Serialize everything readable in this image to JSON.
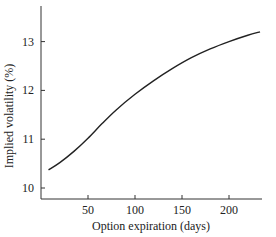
{
  "chart_data": {
    "type": "line",
    "title": "",
    "xlabel": "Option expiration (days)",
    "ylabel": "Implied volatility (%)",
    "xlim": [
      0,
      245
    ],
    "ylim": [
      9.8,
      13.8
    ],
    "x_ticks": [
      50,
      100,
      150,
      200
    ],
    "y_ticks": [
      10,
      11,
      12,
      13
    ],
    "grid": false,
    "legend": null,
    "series": [
      {
        "name": "Implied volatility",
        "x": [
          8,
          20,
          35,
          50,
          65,
          80,
          100,
          120,
          140,
          160,
          180,
          200,
          220,
          233
        ],
        "values": [
          10.37,
          10.52,
          10.75,
          11.02,
          11.32,
          11.6,
          11.92,
          12.2,
          12.45,
          12.67,
          12.85,
          13.0,
          13.13,
          13.2
        ]
      }
    ]
  }
}
